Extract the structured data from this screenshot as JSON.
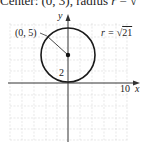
{
  "caption": {
    "prefix": "Center: (0, 3), radius ",
    "var": "r",
    "suffix": " = √"
  },
  "figure": {
    "axis_x_label": "x",
    "axis_y_label": "y",
    "x_tick_label": "10",
    "y_tick_label": "2",
    "point_label": "(0, 5)",
    "radius_label_prefix": "r = ",
    "radius_label_radical": "√",
    "radius_label_value": "21",
    "colors": {
      "curve": "#1a1a1a",
      "axis": "#333333",
      "grid": "#d8d8d8"
    }
  }
}
